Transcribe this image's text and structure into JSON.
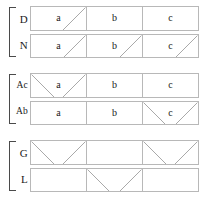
{
  "figure": {
    "title": "",
    "background_color": "#ffffff",
    "border_color": "#b8b8b8",
    "mark_color": "#a9a9a9",
    "bracket_color": "#4a4a4a",
    "text_color": "#1a1a1a"
  },
  "columns": [
    "a",
    "b",
    "c"
  ],
  "groups": [
    {
      "id": "group-0",
      "rows": [
        {
          "label": "D",
          "cells": [
            {
              "text": "a",
              "mark": "diagonal-up"
            },
            {
              "text": "b",
              "mark": "none"
            },
            {
              "text": "c",
              "mark": "none"
            }
          ]
        },
        {
          "label": "N",
          "cells": [
            {
              "text": "a",
              "mark": "diagonal-up"
            },
            {
              "text": "b",
              "mark": "diagonal-up"
            },
            {
              "text": "c",
              "mark": "diagonal-up"
            }
          ]
        }
      ]
    },
    {
      "id": "group-1",
      "rows": [
        {
          "label": "Ac",
          "cells": [
            {
              "text": "a",
              "mark": "cross"
            },
            {
              "text": "b",
              "mark": "none"
            },
            {
              "text": "c",
              "mark": "none"
            }
          ]
        },
        {
          "label": "Ab",
          "cells": [
            {
              "text": "a",
              "mark": "none"
            },
            {
              "text": "b",
              "mark": "none"
            },
            {
              "text": "c",
              "mark": "cross"
            }
          ]
        }
      ]
    },
    {
      "id": "group-2",
      "rows": [
        {
          "label": "G",
          "cells": [
            {
              "text": "",
              "mark": "cross"
            },
            {
              "text": "",
              "mark": "none"
            },
            {
              "text": "",
              "mark": "cross"
            }
          ]
        },
        {
          "label": "L",
          "cells": [
            {
              "text": "",
              "mark": "none"
            },
            {
              "text": "",
              "mark": "cross"
            },
            {
              "text": "",
              "mark": "none"
            }
          ]
        }
      ]
    }
  ]
}
